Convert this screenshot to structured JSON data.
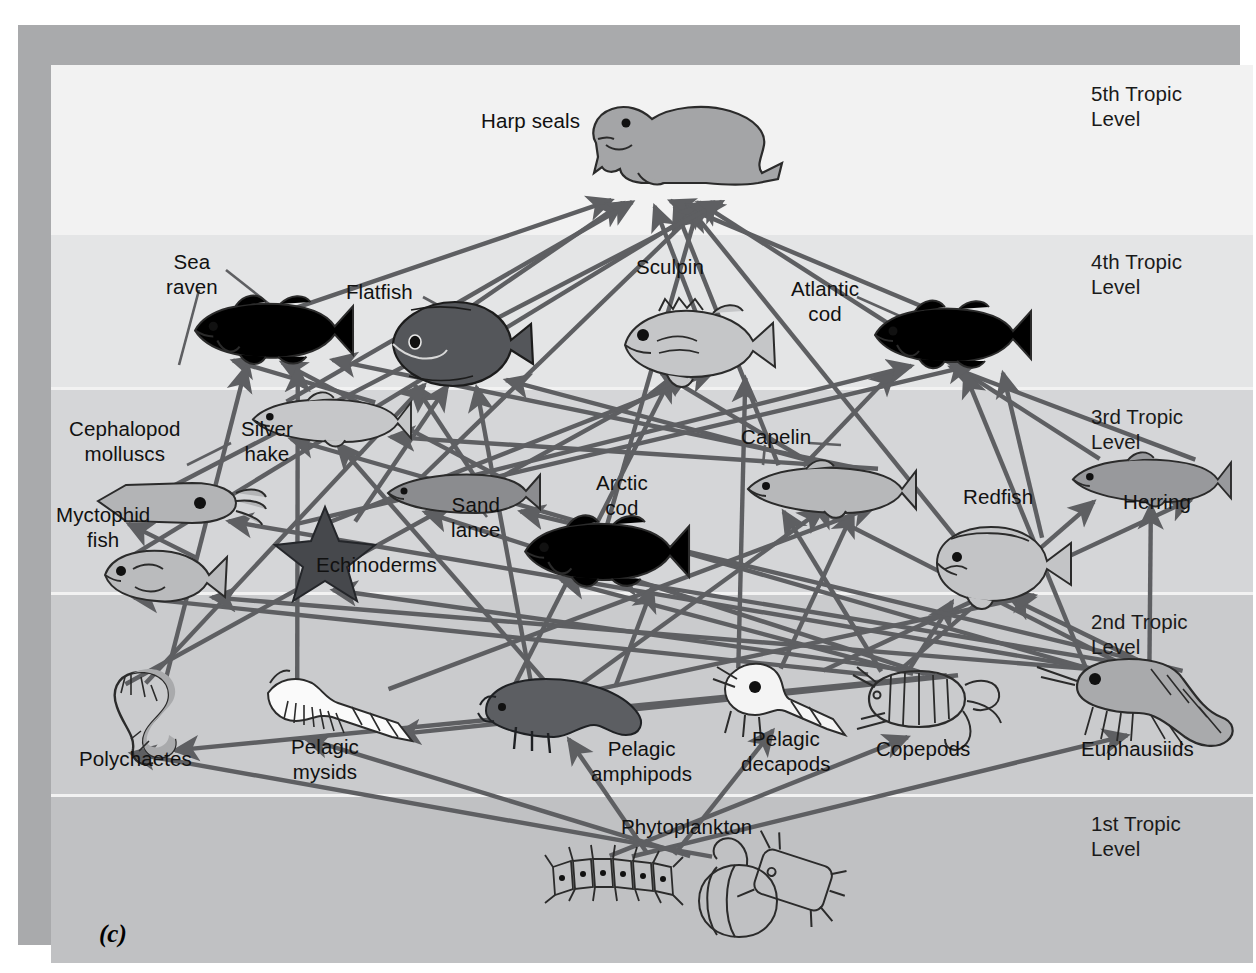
{
  "figure": {
    "letter": "(c)",
    "caption_kind": "marine-food-web",
    "line_color": "#5e5f62"
  },
  "trophic_levels": [
    {
      "id": "t5",
      "label": "5th Tropic\nLevel",
      "band_color": "#f2f2f2",
      "top": 0,
      "height": 168
    },
    {
      "id": "t4",
      "label": "4th Tropic\nLevel",
      "band_color": "#e4e5e6",
      "top": 168,
      "height": 155
    },
    {
      "id": "t3",
      "label": "3rd Tropic\nLevel",
      "band_color": "#d5d6d8",
      "top": 323,
      "height": 205
    },
    {
      "id": "t2",
      "label": "2nd Tropic\nLevel",
      "band_color": "#cacbcd",
      "top": 528,
      "height": 202
    },
    {
      "id": "t1",
      "label": "1st Tropic\nLevel",
      "band_color": "#c0c1c3",
      "top": 730,
      "height": 168
    }
  ],
  "organisms": [
    {
      "id": "harp-seals",
      "label": "Harp seals",
      "level": 5,
      "label_x": 430,
      "label_y": 44,
      "icon_x": 535,
      "icon_y": 22
    },
    {
      "id": "sea-raven",
      "label": "Sea\nraven",
      "level": 4,
      "label_x": 115,
      "label_y": 185,
      "icon_x": 140,
      "icon_y": 235
    },
    {
      "id": "flatfish",
      "label": "Flatfish",
      "level": 4,
      "label_x": 295,
      "label_y": 215,
      "icon_x": 330,
      "icon_y": 235
    },
    {
      "id": "sculpin",
      "label": "Sculpin",
      "level": 4,
      "label_x": 585,
      "label_y": 190,
      "icon_x": 570,
      "icon_y": 240
    },
    {
      "id": "atlantic-cod",
      "label": "Atlantic\ncod",
      "level": 4,
      "label_x": 740,
      "label_y": 212,
      "icon_x": 820,
      "icon_y": 240
    },
    {
      "id": "cephalopod-molluscs",
      "label": "Cephalopod\nmolluscs",
      "level": 3,
      "label_x": 18,
      "label_y": 352,
      "icon_x": 45,
      "icon_y": 414
    },
    {
      "id": "silver-hake",
      "label": "Silver\nhake",
      "level": 3,
      "label_x": 190,
      "label_y": 352,
      "icon_x": 200,
      "icon_y": 330
    },
    {
      "id": "myctophid-fish",
      "label": "Myctophid\nfish",
      "level": 3,
      "label_x": 5,
      "label_y": 438,
      "icon_x": 50,
      "icon_y": 484
    },
    {
      "id": "echinoderms",
      "label": "Echinoderms",
      "level": 3,
      "label_x": 265,
      "label_y": 488,
      "icon_x": 228,
      "icon_y": 442
    },
    {
      "id": "sand-lance",
      "label": "Sand\nlance",
      "level": 3,
      "label_x": 400,
      "label_y": 428,
      "icon_x": 335,
      "icon_y": 408
    },
    {
      "id": "arctic-cod",
      "label": "Arctic\ncod",
      "level": 3,
      "label_x": 545,
      "label_y": 406,
      "icon_x": 470,
      "icon_y": 455
    },
    {
      "id": "capelin",
      "label": "Capelin",
      "level": 3,
      "label_x": 690,
      "label_y": 360,
      "icon_x": 695,
      "icon_y": 398
    },
    {
      "id": "redfish",
      "label": "Redfish",
      "level": 3,
      "label_x": 912,
      "label_y": 420,
      "icon_x": 880,
      "icon_y": 460
    },
    {
      "id": "herring",
      "label": "Herring",
      "level": 3,
      "label_x": 1072,
      "label_y": 425,
      "icon_x": 1020,
      "icon_y": 390
    },
    {
      "id": "polychaetes",
      "label": "Polychaetes",
      "level": 2,
      "label_x": 28,
      "label_y": 682,
      "icon_x": 60,
      "icon_y": 604
    },
    {
      "id": "pelagic-mysids",
      "label": "Pelagic\nmysids",
      "level": 2,
      "label_x": 240,
      "label_y": 670,
      "icon_x": 215,
      "icon_y": 612
    },
    {
      "id": "pelagic-amphipods",
      "label": "Pelagic\namphipods",
      "level": 2,
      "label_x": 540,
      "label_y": 672,
      "icon_x": 425,
      "icon_y": 612
    },
    {
      "id": "pelagic-decapods",
      "label": "Pelagic\ndecapods",
      "level": 2,
      "label_x": 690,
      "label_y": 662,
      "icon_x": 660,
      "icon_y": 600
    },
    {
      "id": "copepods",
      "label": "Copepods",
      "level": 2,
      "label_x": 825,
      "label_y": 672,
      "icon_x": 800,
      "icon_y": 602
    },
    {
      "id": "euphausiids",
      "label": "Euphausiids",
      "level": 2,
      "label_x": 1030,
      "label_y": 672,
      "icon_x": 1020,
      "icon_y": 590
    },
    {
      "id": "phytoplankton",
      "label": "Phytoplankton",
      "level": 1,
      "label_x": 570,
      "label_y": 750,
      "icon_x": 500,
      "icon_y": 790
    }
  ],
  "feeding_links": [
    [
      "sea-raven",
      "harp-seals"
    ],
    [
      "flatfish",
      "harp-seals"
    ],
    [
      "silver-hake",
      "harp-seals"
    ],
    [
      "sculpin",
      "harp-seals"
    ],
    [
      "atlantic-cod",
      "harp-seals"
    ],
    [
      "capelin",
      "harp-seals"
    ],
    [
      "redfish",
      "harp-seals"
    ],
    [
      "herring",
      "harp-seals"
    ],
    [
      "arctic-cod",
      "harp-seals"
    ],
    [
      "sand-lance",
      "harp-seals"
    ],
    [
      "myctophid-fish",
      "harp-seals"
    ],
    [
      "cephalopod-molluscs",
      "harp-seals"
    ],
    [
      "capelin",
      "atlantic-cod"
    ],
    [
      "sand-lance",
      "atlantic-cod"
    ],
    [
      "herring",
      "atlantic-cod"
    ],
    [
      "euphausiids",
      "atlantic-cod"
    ],
    [
      "echinoderms",
      "atlantic-cod"
    ],
    [
      "redfish",
      "atlantic-cod"
    ],
    [
      "capelin",
      "sculpin"
    ],
    [
      "pelagic-amphipods",
      "sculpin"
    ],
    [
      "polychaetes",
      "sculpin"
    ],
    [
      "echinoderms",
      "sculpin"
    ],
    [
      "pelagic-decapods",
      "sculpin"
    ],
    [
      "sand-lance",
      "flatfish"
    ],
    [
      "polychaetes",
      "flatfish"
    ],
    [
      "echinoderms",
      "flatfish"
    ],
    [
      "pelagic-amphipods",
      "flatfish"
    ],
    [
      "capelin",
      "flatfish"
    ],
    [
      "silver-hake",
      "sea-raven"
    ],
    [
      "polychaetes",
      "sea-raven"
    ],
    [
      "sand-lance",
      "sea-raven"
    ],
    [
      "pelagic-mysids",
      "sea-raven"
    ],
    [
      "capelin",
      "sea-raven"
    ],
    [
      "euphausiids",
      "silver-hake"
    ],
    [
      "pelagic-amphipods",
      "silver-hake"
    ],
    [
      "capelin",
      "silver-hake"
    ],
    [
      "myctophid-fish",
      "cephalopod-molluscs"
    ],
    [
      "euphausiids",
      "cephalopod-molluscs"
    ],
    [
      "copepods",
      "myctophid-fish"
    ],
    [
      "euphausiids",
      "myctophid-fish"
    ],
    [
      "copepods",
      "capelin"
    ],
    [
      "euphausiids",
      "capelin"
    ],
    [
      "pelagic-amphipods",
      "capelin"
    ],
    [
      "pelagic-decapods",
      "capelin"
    ],
    [
      "pelagic-mysids",
      "capelin"
    ],
    [
      "copepods",
      "herring"
    ],
    [
      "euphausiids",
      "herring"
    ],
    [
      "pelagic-decapods",
      "herring"
    ],
    [
      "copepods",
      "redfish"
    ],
    [
      "euphausiids",
      "redfish"
    ],
    [
      "pelagic-amphipods",
      "redfish"
    ],
    [
      "copepods",
      "arctic-cod"
    ],
    [
      "euphausiids",
      "arctic-cod"
    ],
    [
      "pelagic-amphipods",
      "arctic-cod"
    ],
    [
      "copepods",
      "sand-lance"
    ],
    [
      "euphausiids",
      "sand-lance"
    ],
    [
      "phytoplankton",
      "copepods"
    ],
    [
      "phytoplankton",
      "euphausiids"
    ],
    [
      "phytoplankton",
      "pelagic-amphipods"
    ],
    [
      "phytoplankton",
      "pelagic-decapods"
    ],
    [
      "phytoplankton",
      "pelagic-mysids"
    ],
    [
      "phytoplankton",
      "polychaetes"
    ],
    [
      "copepods",
      "echinoderms"
    ],
    [
      "copepods",
      "polychaetes"
    ],
    [
      "copepods",
      "pelagic-mysids"
    ]
  ],
  "chart_data": {
    "type": "diagram",
    "levels": [
      "1st Tropic Level",
      "2nd Tropic Level",
      "3rd Tropic Level",
      "4th Tropic Level",
      "5th Tropic Level"
    ],
    "level_members": {
      "1st Tropic Level": [
        "Phytoplankton"
      ],
      "2nd Tropic Level": [
        "Polychaetes",
        "Pelagic mysids",
        "Pelagic amphipods",
        "Pelagic decapods",
        "Copepods",
        "Euphausiids"
      ],
      "3rd Tropic Level": [
        "Cephalopod molluscs",
        "Myctophid fish",
        "Silver hake",
        "Echinoderms",
        "Sand lance",
        "Arctic cod",
        "Capelin",
        "Redfish",
        "Herring"
      ],
      "4th Tropic Level": [
        "Sea raven",
        "Flatfish",
        "Sculpin",
        "Atlantic cod"
      ],
      "5th Tropic Level": [
        "Harp seals"
      ]
    },
    "edge_count": 66,
    "legend": []
  }
}
